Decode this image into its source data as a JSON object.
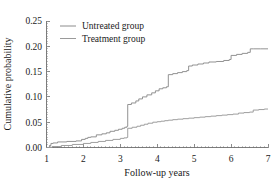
{
  "chart_data": {
    "type": "line",
    "title": "",
    "subtitle": "",
    "xlabel": "Follow-up years",
    "ylabel": "Cumulative probability",
    "xlim": [
      1,
      7
    ],
    "ylim": [
      0.0,
      0.25
    ],
    "xticks": [
      1,
      2,
      3,
      4,
      5,
      6,
      7
    ],
    "xticklabels": [
      "1",
      "2",
      "3",
      "4",
      "5",
      "6",
      "7"
    ],
    "yticks": [
      0.0,
      0.05,
      0.1,
      0.15,
      0.2,
      0.25
    ],
    "yticklabels": [
      "0.00",
      "0.05",
      "0.10",
      "0.15",
      "0.20",
      "0.25"
    ],
    "grid": false,
    "legend_position": "upper left",
    "step_style": "post",
    "series": [
      {
        "name": "Untreated group",
        "color": "#8c8c8c",
        "x": [
          1.0,
          1.08,
          1.12,
          1.18,
          1.3,
          1.55,
          1.8,
          1.95,
          2.05,
          2.12,
          2.2,
          2.35,
          2.5,
          2.62,
          2.72,
          2.85,
          2.95,
          3.05,
          3.12,
          3.18,
          3.2,
          3.3,
          3.42,
          3.5,
          3.6,
          3.72,
          3.85,
          3.95,
          4.05,
          4.15,
          4.25,
          4.3,
          4.42,
          4.55,
          4.68,
          4.8,
          4.85,
          4.95,
          5.1,
          5.25,
          5.4,
          5.6,
          5.8,
          5.95,
          6.0,
          6.15,
          6.3,
          6.45,
          6.52,
          6.6,
          6.8,
          7.0
        ],
        "y": [
          0.0,
          0.004,
          0.008,
          0.009,
          0.011,
          0.012,
          0.013,
          0.016,
          0.018,
          0.02,
          0.021,
          0.025,
          0.027,
          0.029,
          0.032,
          0.034,
          0.036,
          0.038,
          0.04,
          0.042,
          0.085,
          0.088,
          0.092,
          0.096,
          0.1,
          0.104,
          0.108,
          0.112,
          0.116,
          0.118,
          0.12,
          0.144,
          0.146,
          0.148,
          0.15,
          0.152,
          0.161,
          0.163,
          0.165,
          0.167,
          0.169,
          0.17,
          0.172,
          0.174,
          0.182,
          0.184,
          0.186,
          0.188,
          0.195,
          0.195,
          0.195,
          0.195
        ]
      },
      {
        "name": "Treatment group",
        "color": "#9a9a9a",
        "x": [
          1.0,
          1.15,
          1.4,
          1.7,
          2.0,
          2.2,
          2.4,
          2.6,
          2.8,
          3.0,
          3.1,
          3.18,
          3.2,
          3.32,
          3.45,
          3.55,
          3.65,
          3.75,
          3.88,
          4.0,
          4.1,
          4.2,
          4.3,
          4.42,
          4.55,
          4.7,
          4.85,
          5.0,
          5.15,
          5.3,
          5.45,
          5.6,
          5.75,
          5.9,
          6.05,
          6.2,
          6.35,
          6.5,
          6.6,
          6.75,
          6.9,
          7.0
        ],
        "y": [
          0.0,
          0.002,
          0.004,
          0.006,
          0.008,
          0.01,
          0.012,
          0.014,
          0.016,
          0.018,
          0.019,
          0.02,
          0.038,
          0.04,
          0.042,
          0.044,
          0.046,
          0.048,
          0.05,
          0.051,
          0.052,
          0.053,
          0.054,
          0.055,
          0.056,
          0.057,
          0.058,
          0.059,
          0.06,
          0.061,
          0.062,
          0.063,
          0.064,
          0.065,
          0.066,
          0.068,
          0.069,
          0.07,
          0.074,
          0.075,
          0.076,
          0.076
        ]
      }
    ],
    "legend": [
      {
        "label": "Untreated group",
        "color": "#8c8c8c"
      },
      {
        "label": "Treatment group",
        "color": "#9a9a9a"
      }
    ],
    "annotations": []
  }
}
